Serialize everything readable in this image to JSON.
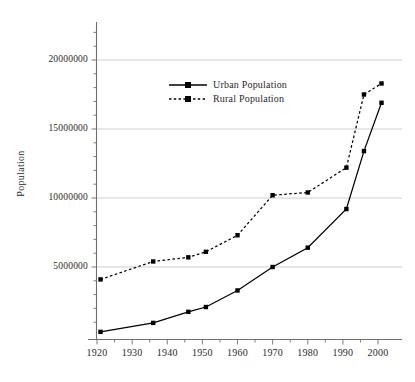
{
  "chart_data": {
    "type": "line",
    "title": "",
    "xlabel": "",
    "ylabel": "Population",
    "x": [
      1921,
      1936,
      1946,
      1951,
      1960,
      1970,
      1980,
      1991,
      1996,
      2001
    ],
    "xlim": [
      1915,
      2005
    ],
    "ylim": [
      0,
      23000000
    ],
    "ytick_values": [
      5000000,
      10000000,
      15000000,
      20000000
    ],
    "ytick_labels": [
      "5000000",
      "10000000",
      "15000000",
      "20000000"
    ],
    "xtick_values": [
      1920,
      1930,
      1940,
      1950,
      1960,
      1970,
      1980,
      1990,
      2000
    ],
    "xtick_labels": [
      "1920",
      "1930",
      "1940",
      "1950",
      "1960",
      "1970",
      "1980",
      "1990",
      "2000"
    ],
    "grid": "horizontal",
    "legend_position": "upper-center-left",
    "series": [
      {
        "name": "Urban Population",
        "style": "solid",
        "marker": "square",
        "color": "#000000",
        "values": [
          300000,
          950000,
          1750000,
          2100000,
          3300000,
          5000000,
          6400000,
          9200000,
          13400000,
          16900000
        ]
      },
      {
        "name": "Rural Population",
        "style": "dashed",
        "marker": "square",
        "color": "#000000",
        "values": [
          4100000,
          5400000,
          5700000,
          6100000,
          7300000,
          10200000,
          10400000,
          12200000,
          17500000,
          18300000
        ]
      }
    ]
  },
  "legend": {
    "items": [
      {
        "label": "Urban Population"
      },
      {
        "label": "Rural Population"
      }
    ]
  },
  "axes": {
    "y_axis_label": "Population"
  }
}
